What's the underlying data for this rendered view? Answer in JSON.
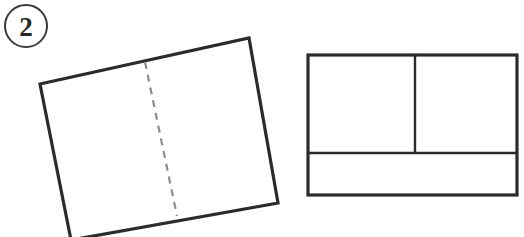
{
  "diagram": {
    "step_badge": {
      "name": "step-number-badge",
      "label": "2",
      "shape": "circle",
      "center_x": 26,
      "center_y": 26,
      "radius": 21,
      "stroke_color": "#3a3a3a",
      "stroke_width": 2,
      "text_color": "#262626"
    },
    "canvas": {
      "width": 524,
      "height": 237,
      "background_color": "#ffffff"
    },
    "ink_color": "#2b2b2b",
    "dash_color": "#8c8c8c",
    "shapes": [
      {
        "name": "tilted-square-panel",
        "type": "polygon",
        "description": "rotated square sheet viewed at an angle",
        "points": "40,84 249,38 278,203 71,240",
        "stroke_color": "#2b2b2b",
        "stroke_width": 3.2,
        "fill": "#ffffff"
      },
      {
        "name": "fold-crease-dashed-line",
        "type": "dashed-line",
        "description": "vertical dashed fold crease on tilted square",
        "x1": 145,
        "y1": 62,
        "x2": 177,
        "y2": 216,
        "stroke_color": "#8c8c8c",
        "stroke_width": 2.2,
        "dash_pattern": "7 6"
      },
      {
        "name": "flat-rectangle-panel",
        "type": "rectangle",
        "description": "flat rectangle divided into panels",
        "x": 308,
        "y": 55,
        "width": 209,
        "height": 140,
        "stroke_color": "#2b2b2b",
        "stroke_width": 3.2,
        "fill": "#ffffff"
      },
      {
        "name": "horizontal-divider-line",
        "type": "line",
        "description": "horizontal division across flat rectangle",
        "x1": 308,
        "y1": 153,
        "x2": 517,
        "y2": 153,
        "stroke_color": "#2b2b2b",
        "stroke_width": 2.4
      },
      {
        "name": "vertical-divider-line",
        "type": "line",
        "description": "vertical division in upper portion of flat rectangle",
        "x1": 415,
        "y1": 55,
        "x2": 415,
        "y2": 153,
        "stroke_color": "#2b2b2b",
        "stroke_width": 2.4
      }
    ]
  }
}
